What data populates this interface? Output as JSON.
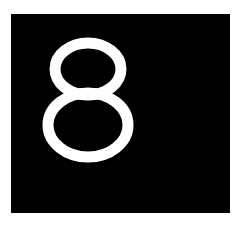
{
  "card": {
    "label": "8",
    "background_color": "#000000",
    "text_color": "#ffffff"
  },
  "page": {
    "background_color": "#ffffff"
  }
}
